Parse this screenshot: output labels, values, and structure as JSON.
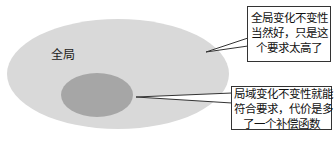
{
  "diagram": {
    "outer_region": {
      "label": "全局",
      "fill": "#d9d9d9"
    },
    "inner_region": {
      "label": "",
      "fill": "#a6a6a6"
    },
    "callouts": [
      {
        "target": "outer_region",
        "lines": [
          "全局变化不变性",
          "当然好，只是这",
          "个要求太高了"
        ]
      },
      {
        "target": "inner_region",
        "lines": [
          "局域变化不变性就能",
          "符合要求，代价是多",
          "了一个补偿函数"
        ]
      }
    ],
    "colors": {
      "background": "#ffffff",
      "outline": "#333333",
      "text": "#111111"
    }
  }
}
